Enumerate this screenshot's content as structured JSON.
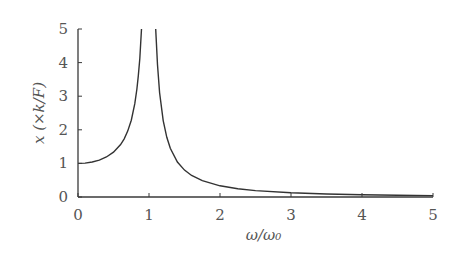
{
  "chart_data": {
    "type": "line",
    "title": "",
    "xlabel": "ω/ω₀",
    "ylabel": "x  (×k/F)",
    "xlim": [
      0,
      5
    ],
    "ylim": [
      0,
      5
    ],
    "xticks": [
      0,
      1,
      2,
      3,
      4,
      5
    ],
    "yticks": [
      0,
      1,
      2,
      3,
      4,
      5
    ],
    "xtick_labels": [
      "0",
      "1",
      "2",
      "3",
      "4",
      "5"
    ],
    "ytick_labels": [
      "0",
      "1",
      "2",
      "3",
      "4",
      "5"
    ],
    "grid": false,
    "legend": null,
    "series": [
      {
        "name": "below-resonance",
        "x": [
          0,
          0.1,
          0.2,
          0.3,
          0.4,
          0.5,
          0.6,
          0.65,
          0.7,
          0.75,
          0.8,
          0.83,
          0.85,
          0.87,
          0.894
        ],
        "y": [
          1.0,
          1.01,
          1.042,
          1.099,
          1.19,
          1.333,
          1.563,
          1.732,
          1.961,
          2.286,
          2.778,
          3.213,
          3.604,
          4.115,
          5.0
        ]
      },
      {
        "name": "above-resonance",
        "x": [
          1.095,
          1.1,
          1.12,
          1.15,
          1.2,
          1.25,
          1.3,
          1.4,
          1.5,
          1.6,
          1.75,
          2.0,
          2.25,
          2.5,
          3.0,
          3.5,
          4.0,
          4.5,
          5.0
        ],
        "y": [
          5.0,
          4.762,
          3.935,
          3.101,
          2.273,
          1.778,
          1.449,
          1.042,
          0.8,
          0.641,
          0.485,
          0.333,
          0.246,
          0.19,
          0.125,
          0.089,
          0.067,
          0.052,
          0.042
        ]
      }
    ]
  }
}
